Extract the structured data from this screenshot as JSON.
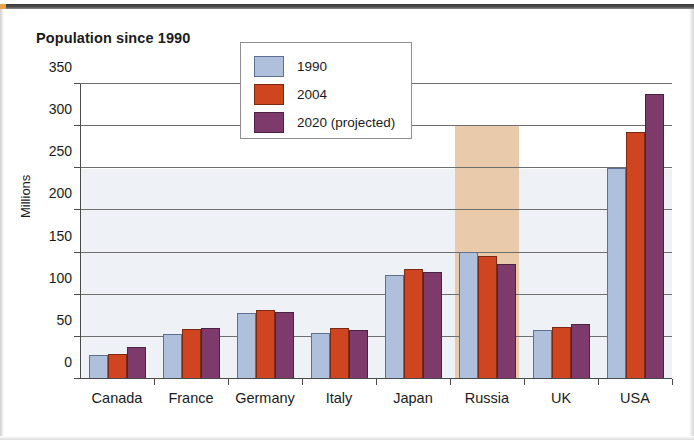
{
  "page": {
    "title": "Population since 1990"
  },
  "ghost_text": {
    "line1": "political policies",
    "line2": "has been an inde",
    "line3": "mind control reso",
    "line4": "the considerati"
  },
  "legend": {
    "items": [
      {
        "label": "1990",
        "color": "#aec0dc",
        "swatch_name": "legend-swatch-1990"
      },
      {
        "label": "2004",
        "color": "#cf451f",
        "swatch_name": "legend-swatch-2004"
      },
      {
        "label": "2020 (projected)",
        "color": "#7e3a6b",
        "swatch_name": "legend-swatch-2020"
      }
    ]
  },
  "chart_data": {
    "type": "bar",
    "title": "Population since 1990",
    "xlabel": "",
    "ylabel": "Millions",
    "ylim": [
      0,
      350
    ],
    "yticks": [
      0,
      50,
      100,
      150,
      200,
      250,
      300,
      350
    ],
    "ytick_labels": [
      "0",
      "50",
      "100",
      "150",
      "200",
      "250",
      "300",
      "350"
    ],
    "grid": true,
    "legend_position": "top-center",
    "categories": [
      "Canada",
      "France",
      "Germany",
      "Italy",
      "Japan",
      "Russia",
      "UK",
      "USA"
    ],
    "series": [
      {
        "name": "1990",
        "color": "#aec0dc",
        "values": [
          28,
          54,
          78,
          55,
          124,
          151,
          58,
          250
        ]
      },
      {
        "name": "2004",
        "color": "#cf451f",
        "values": [
          30,
          59,
          82,
          60,
          130,
          146,
          62,
          293
        ]
      },
      {
        "name": "2020 (projected)",
        "color": "#7e3a6b",
        "values": [
          38,
          60,
          80,
          58,
          127,
          137,
          65,
          338
        ]
      }
    ],
    "annotations": [
      {
        "type": "highlight-band",
        "category": "Russia",
        "color": "#e9cbab",
        "from": 0,
        "to": 300
      }
    ]
  }
}
